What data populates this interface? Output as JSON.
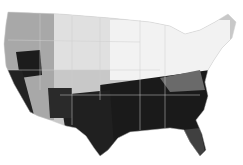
{
  "map": {
    "type": "choropleth",
    "region": "contiguous-united-states",
    "granularity": "county",
    "color_scale": [
      "#ffffff",
      "#d0d0d0",
      "#a0a0a0",
      "#707070",
      "#101010"
    ],
    "background": "#ffffff",
    "border_color": "#cfcfcf",
    "legend": null,
    "title": null
  }
}
